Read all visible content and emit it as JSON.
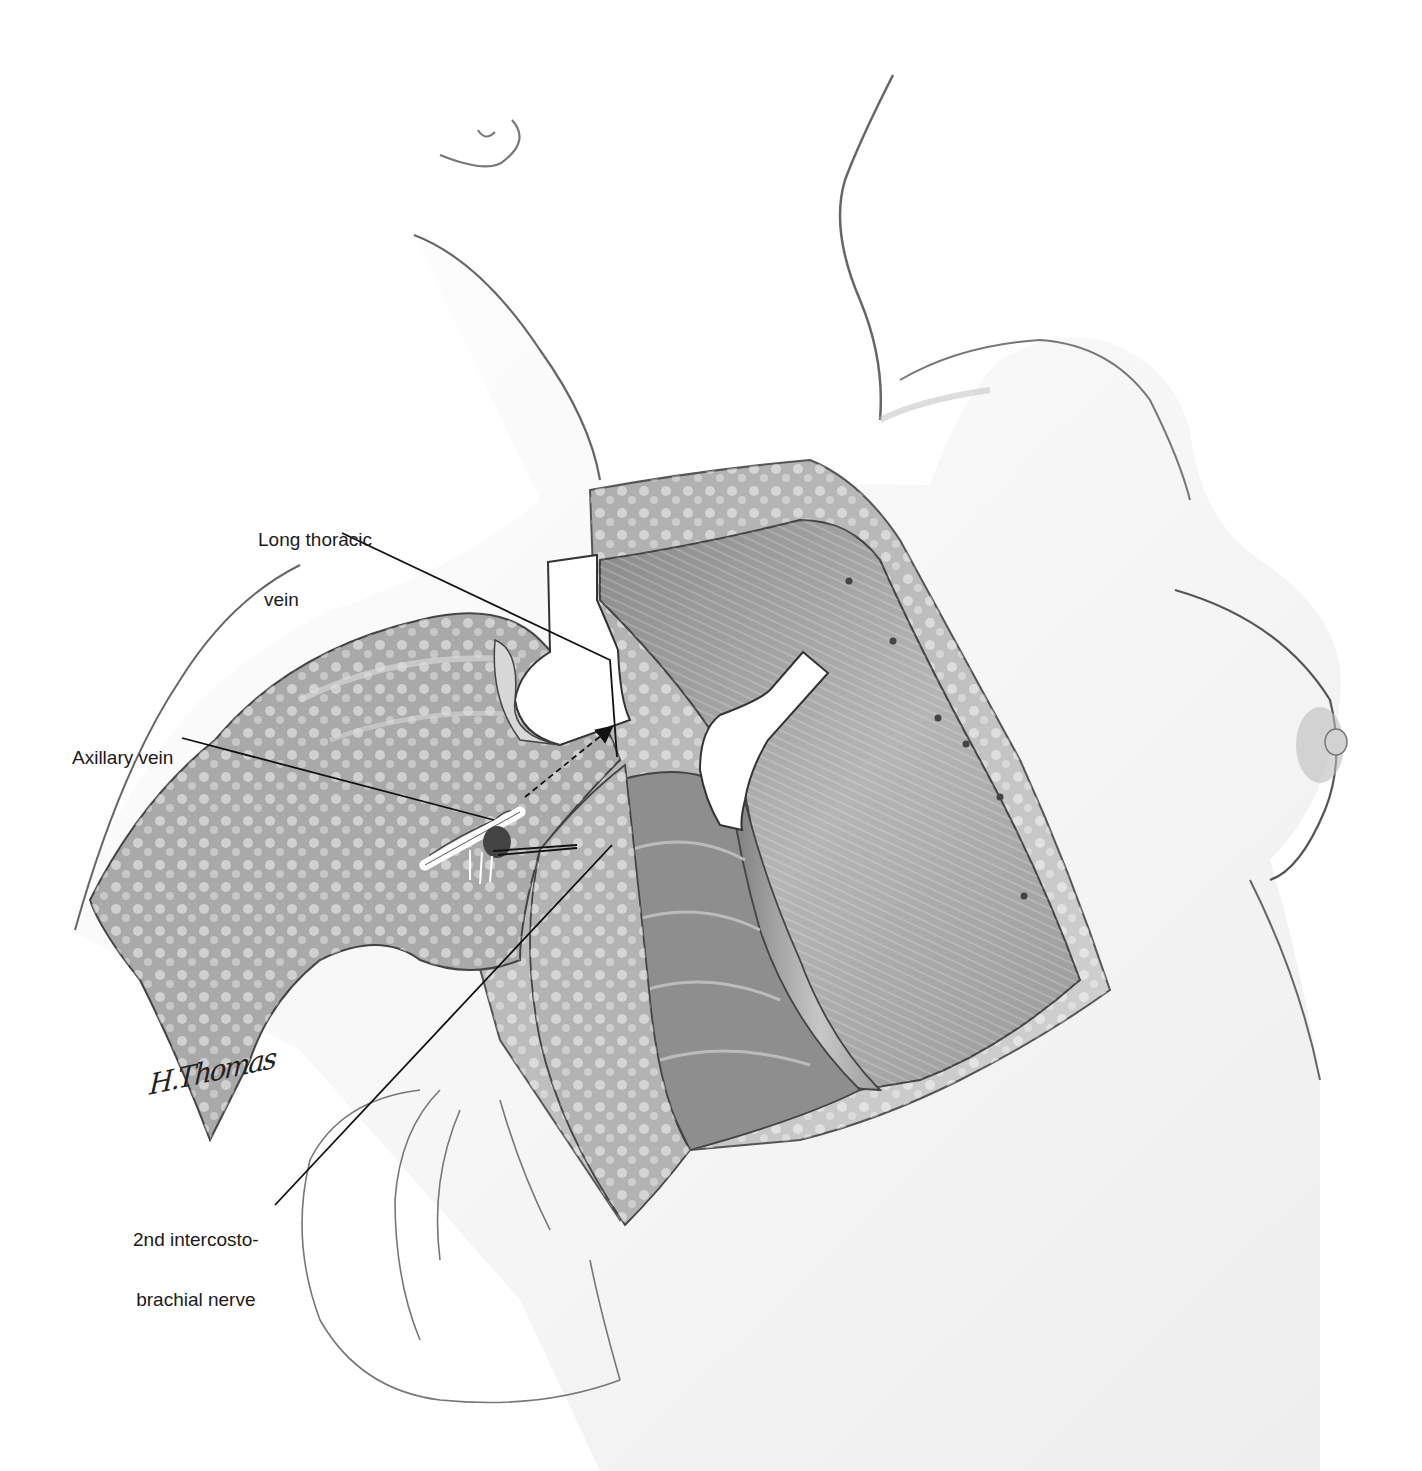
{
  "figure": {
    "type": "surgical anatomy illustration",
    "style": "grayscale medical illustration",
    "colors": {
      "background": "#ffffff",
      "outline": "#555555",
      "muscle_dark": "#6e6e6e",
      "muscle_light": "#b8b8b8",
      "fat": "#c9c9c9",
      "skin": "#f4f4f4",
      "retractor": "#ffffff",
      "leader_line": "#111111"
    }
  },
  "labels": {
    "long_thoracic_vein": {
      "line1": "Long thoracic",
      "line2": "vein"
    },
    "axillary_vein": {
      "line1": "Axillary vein"
    },
    "intercostobrachial_nerve": {
      "line1": "2nd intercosto-",
      "line2": "brachial nerve"
    }
  },
  "signature": {
    "text": "H.Thomas"
  }
}
